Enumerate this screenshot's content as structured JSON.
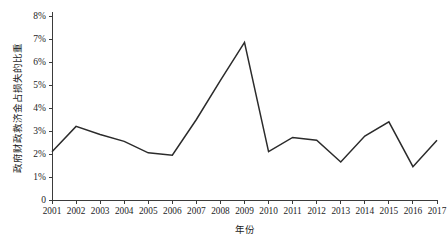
{
  "chart_data": {
    "type": "line",
    "title": "",
    "xlabel": "年份",
    "ylabel": "政府财政救济金占损失的比重",
    "categories": [
      "2001",
      "2002",
      "2003",
      "2004",
      "2005",
      "2006",
      "2007",
      "2008",
      "2009",
      "2010",
      "2011",
      "2012",
      "2013",
      "2014",
      "2015",
      "2016",
      "2017"
    ],
    "series": [
      {
        "name": "政府财政救济金占损失的比重",
        "values": [
          2.1,
          3.2,
          2.85,
          2.55,
          2.05,
          1.95,
          3.5,
          5.2,
          6.85,
          2.1,
          2.72,
          2.6,
          1.65,
          2.78,
          3.4,
          1.45,
          2.6
        ]
      }
    ],
    "ylim": [
      0,
      8
    ],
    "yticks": [
      0,
      1,
      2,
      3,
      4,
      5,
      6,
      7,
      8
    ],
    "ytick_labels": [
      "0",
      "1%",
      "2%",
      "3%",
      "4%",
      "5%",
      "6%",
      "7%",
      "8%"
    ],
    "grid": false,
    "legend": false,
    "legend_position": "none",
    "value_unit": "%",
    "line_color": "#2b2b2b",
    "background_color": "#ffffff",
    "axis_color": "#3b3b3b"
  }
}
